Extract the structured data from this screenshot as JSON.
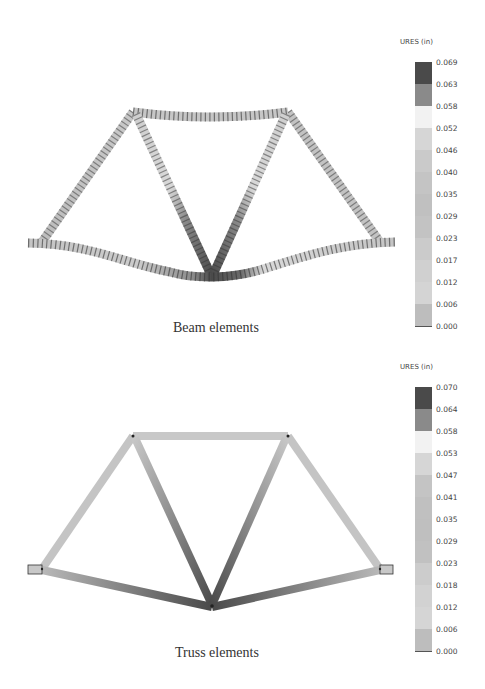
{
  "figure": {
    "panels": [
      {
        "id": "beam",
        "caption": "Beam elements",
        "legend": {
          "title": "URES (in)",
          "labels": [
            "0.069",
            "0.063",
            "0.058",
            "0.052",
            "0.046",
            "0.040",
            "0.035",
            "0.029",
            "0.023",
            "0.017",
            "0.012",
            "0.006",
            "0.000"
          ],
          "colors": [
            "#4a4a4a",
            "#8a8a8a",
            "#f2f2f2",
            "#d6d6d6",
            "#cacaca",
            "#c4c4c4",
            "#c0c0c0",
            "#c3c3c3",
            "#cbcbcb",
            "#d0d0d0",
            "#d4d4d4",
            "#bdbdbd"
          ]
        }
      },
      {
        "id": "truss",
        "caption": "Truss elements",
        "legend": {
          "title": "URES (in)",
          "labels": [
            "0.070",
            "0.064",
            "0.058",
            "0.053",
            "0.047",
            "0.041",
            "0.035",
            "0.029",
            "0.023",
            "0.018",
            "0.012",
            "0.006",
            "0.000"
          ],
          "colors": [
            "#4a4a4a",
            "#8a8a8a",
            "#f2f2f2",
            "#d6d6d6",
            "#c4c4c4",
            "#c0c0c0",
            "#bfbfbf",
            "#c1c1c1",
            "#cccccc",
            "#d2d2d2",
            "#d5d5d5",
            "#bdbdbd"
          ]
        }
      }
    ]
  }
}
